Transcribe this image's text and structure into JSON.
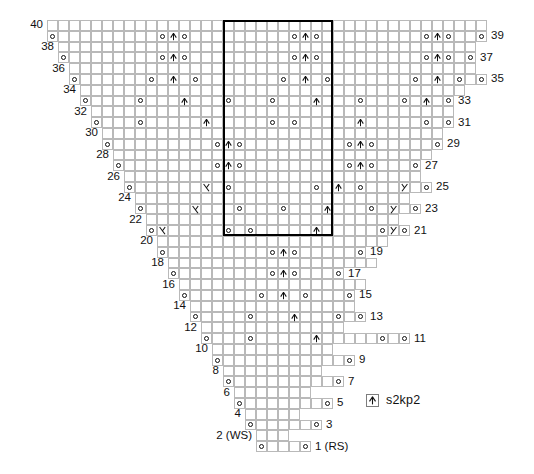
{
  "chart_data": {
    "type": "table",
    "grid": {
      "columns": 40,
      "rows": 40,
      "center_column": 20
    },
    "symbols": {
      "o": {
        "name": "yarn-over",
        "label": "yo"
      },
      "A": {
        "name": "s2kp2-centered-double-decrease",
        "label": "s2kp2"
      },
      "L": {
        "name": "left-leaning-decrease",
        "label": "ssk"
      },
      "R": {
        "name": "right-leaning-decrease",
        "label": "k2tog"
      },
      ".": {
        "name": "knit-blank",
        "label": ""
      },
      " ": {
        "name": "no-stitch",
        "label": ""
      }
    },
    "legend": [
      {
        "symbol": "A",
        "label": "s2kp2"
      }
    ],
    "axis_note_rs": "1 (RS)",
    "axis_note_ws": "2 (WS)",
    "repeat_box": {
      "start_col": 16,
      "end_col": 25,
      "start_row": 21,
      "end_row": 40
    },
    "rows": [
      {
        "num": 40,
        "side": "WS",
        "num_side": "left",
        "start": 0,
        "cells": "........................................"
      },
      {
        "num": 39,
        "side": "RS",
        "num_side": "right",
        "start": 0,
        "cells": "o.........oAo.........oAo.........oAo..o"
      },
      {
        "num": 38,
        "side": "WS",
        "num_side": "left",
        "start": 1,
        "cells": "......................................"
      },
      {
        "num": 37,
        "side": "RS",
        "num_side": "right",
        "start": 1,
        "cells": "o........oAo.........oAo.........oAo.o"
      },
      {
        "num": 36,
        "side": "WS",
        "num_side": "left",
        "start": 2,
        "cells": "....................................."
      },
      {
        "num": 35,
        "side": "RS",
        "num_side": "right",
        "start": 2,
        "cells": "o......o.A.o.......o.A.o.......o.A.o.o"
      },
      {
        "num": 34,
        "side": "WS",
        "num_side": "left",
        "start": 3,
        "cells": "..................................."
      },
      {
        "num": 33,
        "side": "RS",
        "num_side": "right",
        "start": 3,
        "cells": "o....o...A...o...o...A...o...o.A.o"
      },
      {
        "num": 32,
        "side": "WS",
        "num_side": "left",
        "start": 4,
        "cells": "................................."
      },
      {
        "num": 31,
        "side": "RS",
        "num_side": "right",
        "start": 4,
        "cells": "o...o.....A.....o.o.....A.....o.o"
      },
      {
        "num": 30,
        "side": "WS",
        "num_side": "left",
        "start": 5,
        "cells": "..............................."
      },
      {
        "num": 29,
        "side": "RS",
        "num_side": "right",
        "start": 5,
        "cells": "o.........oAo.........oAo.....o"
      },
      {
        "num": 28,
        "side": "WS",
        "num_side": "left",
        "start": 6,
        "cells": "............................."
      },
      {
        "num": 27,
        "side": "RS",
        "num_side": "right",
        "start": 6,
        "cells": "o........oAo.........oAo...o"
      },
      {
        "num": 26,
        "side": "WS",
        "num_side": "left",
        "start": 7,
        "cells": "..........................."
      },
      {
        "num": 25,
        "side": "RS",
        "num_side": "right",
        "start": 7,
        "cells": "o......L.o.......o.A.o...R.o"
      },
      {
        "num": 24,
        "side": "WS",
        "num_side": "left",
        "start": 8,
        "cells": "........................."
      },
      {
        "num": 23,
        "side": "RS",
        "num_side": "right",
        "start": 8,
        "cells": "o....L...o...o...A...o.R.o"
      },
      {
        "num": 22,
        "side": "WS",
        "num_side": "left",
        "start": 9,
        "cells": "......................."
      },
      {
        "num": 21,
        "side": "RS",
        "num_side": "right",
        "start": 9,
        "cells": "oL.....o.o.....A.....oRo"
      },
      {
        "num": 20,
        "side": "WS",
        "num_side": "left",
        "start": 10,
        "cells": "....................."
      },
      {
        "num": 19,
        "side": "RS",
        "num_side": "right",
        "start": 10,
        "cells": "o.........oAo.....o"
      },
      {
        "num": 18,
        "side": "WS",
        "num_side": "left",
        "start": 11,
        "cells": "..................."
      },
      {
        "num": 17,
        "side": "RS",
        "num_side": "right",
        "start": 11,
        "cells": "o........oAo...o"
      },
      {
        "num": 16,
        "side": "WS",
        "num_side": "left",
        "start": 12,
        "cells": "................."
      },
      {
        "num": 15,
        "side": "RS",
        "num_side": "right",
        "start": 12,
        "cells": "o......o.A.o...o"
      },
      {
        "num": 14,
        "side": "WS",
        "num_side": "left",
        "start": 13,
        "cells": "..............."
      },
      {
        "num": 13,
        "side": "RS",
        "num_side": "right",
        "start": 13,
        "cells": "o....o...A...o.o"
      },
      {
        "num": 12,
        "side": "WS",
        "num_side": "left",
        "start": 14,
        "cells": "............."
      },
      {
        "num": 11,
        "side": "RS",
        "num_side": "right",
        "start": 14,
        "cells": "o...o.....A.....o.o"
      },
      {
        "num": 10,
        "side": "WS",
        "num_side": "left",
        "start": 15,
        "cells": "..........."
      },
      {
        "num": 9,
        "side": "RS",
        "num_side": "right",
        "start": 15,
        "cells": "o...........o"
      },
      {
        "num": 8,
        "side": "WS",
        "num_side": "left",
        "start": 16,
        "cells": "........."
      },
      {
        "num": 7,
        "side": "RS",
        "num_side": "right",
        "start": 16,
        "cells": "o.........o"
      },
      {
        "num": 6,
        "side": "WS",
        "num_side": "left",
        "start": 17,
        "cells": "......."
      },
      {
        "num": 5,
        "side": "RS",
        "num_side": "right",
        "start": 17,
        "cells": "o.......o"
      },
      {
        "num": 4,
        "side": "WS",
        "num_side": "left",
        "start": 18,
        "cells": "....."
      },
      {
        "num": 3,
        "side": "RS",
        "num_side": "right",
        "start": 18,
        "cells": "o.....o"
      },
      {
        "num": 2,
        "side": "WS",
        "num_side": "left",
        "start": 19,
        "cells": "..."
      },
      {
        "num": 1,
        "side": "RS",
        "num_side": "right",
        "start": 19,
        "cells": "o...o"
      }
    ]
  }
}
